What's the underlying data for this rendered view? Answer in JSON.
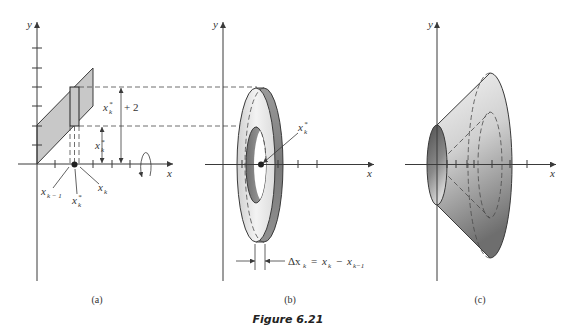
{
  "figure": {
    "caption": "Figure 6.21"
  },
  "colors": {
    "stroke": "#3a3a3a",
    "region_fill": "#c8c8c8",
    "background": "#ffffff"
  },
  "panels": [
    {
      "id": "a",
      "label": "(a)",
      "axes": {
        "x": "x",
        "y": "y"
      },
      "annotations": {
        "outer_radius": {
          "base": "x",
          "sub": "k",
          "sup": "*",
          "suffix": "+ 2"
        },
        "inner_radius": {
          "base": "x",
          "sub": "k",
          "sup": "*"
        },
        "point_left": {
          "base": "x",
          "sub": "k − 1"
        },
        "point_mid": {
          "base": "x",
          "sub": "k",
          "sup": "*"
        },
        "point_right": {
          "base": "x",
          "sub": "k"
        }
      }
    },
    {
      "id": "b",
      "label": "(b)",
      "axes": {
        "x": "x",
        "y": "y"
      },
      "annotations": {
        "center_point": {
          "base": "x",
          "sub": "k",
          "sup": "*"
        },
        "thickness": {
          "delta": "Δx",
          "delta_sub": "k",
          "equals": "=",
          "term1": "x",
          "term1_sub": "k",
          "minus": "−",
          "term2": "x",
          "term2_sub": "k−1"
        }
      }
    },
    {
      "id": "c",
      "label": "(c)",
      "axes": {
        "x": "x",
        "y": "y"
      }
    }
  ]
}
